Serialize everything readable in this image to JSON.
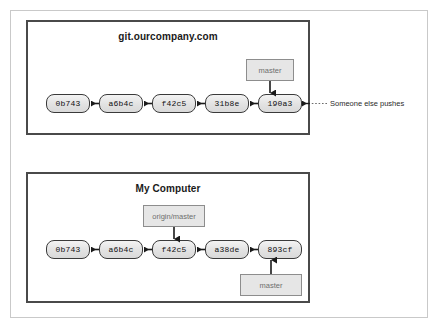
{
  "figure": {
    "title_hidden": "",
    "panels": [
      {
        "id": "server",
        "title": "git.ourcompany.com",
        "commits": [
          "0b743",
          "a6b4c",
          "f42c5",
          "31b8e",
          "190a3"
        ],
        "labels": [
          {
            "text": "master",
            "points_to": "190a3"
          }
        ]
      },
      {
        "id": "local",
        "title": "My Computer",
        "commits": [
          "0b743",
          "a6b4c",
          "f42c5",
          "a38de",
          "893cf"
        ],
        "labels": [
          {
            "text": "origin/master",
            "points_to": "f42c5"
          },
          {
            "text": "master",
            "points_to": "893cf"
          }
        ]
      }
    ],
    "annotations": [
      {
        "text": "Someone else pushes",
        "target": "190a3"
      }
    ]
  },
  "colors": {
    "panel_border": "#4a4a4a",
    "outer_frame": "#c9c9c9",
    "node_fill": "#e2e2e2",
    "node_border": "#3a3a3a",
    "label_fill": "#e6e6e6",
    "label_border": "#8d8d8d",
    "label_text": "#6e6e6e",
    "arrow": "#1a1a1a",
    "background": "#ffffff"
  }
}
